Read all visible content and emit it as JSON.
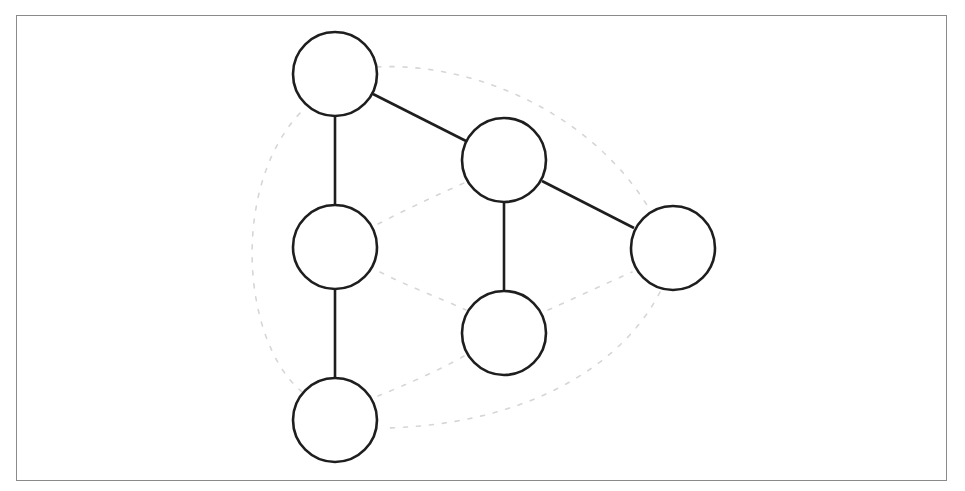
{
  "diagram": {
    "type": "tree-with-traversal-contour",
    "colors": {
      "frame": "#8a8a8a",
      "node_stroke": "#1e1e1e",
      "node_fill": "#ffffff",
      "edge": "#1e1e1e",
      "contour": "#d6d6d6",
      "background": "#ffffff"
    },
    "node_radius": 42,
    "nodes": [
      {
        "id": "root",
        "cx": 335,
        "cy": 74
      },
      {
        "id": "left-child",
        "cx": 335,
        "cy": 247
      },
      {
        "id": "left-grandchild",
        "cx": 335,
        "cy": 420
      },
      {
        "id": "right-child",
        "cx": 504,
        "cy": 160
      },
      {
        "id": "right-child-bottom",
        "cx": 504,
        "cy": 333
      },
      {
        "id": "right-child-right",
        "cx": 673,
        "cy": 248
      }
    ],
    "edges": [
      {
        "from": "root",
        "to": "left-child"
      },
      {
        "from": "left-child",
        "to": "left-grandchild"
      },
      {
        "from": "root",
        "to": "right-child"
      },
      {
        "from": "right-child",
        "to": "right-child-bottom"
      },
      {
        "from": "right-child",
        "to": "right-child-right"
      }
    ],
    "contour_paths": [
      "outer-arc: root -> right-child-right",
      "outer-arc: right-child-right -> left-grandchild",
      "outer-arc: left-grandchild -> root (left side)",
      "inner: left-child -> right-child",
      "inner: left-child -> right-child-bottom",
      "inner: right-child-bottom -> right-child-right",
      "inner: right-child-bottom -> left-grandchild"
    ]
  }
}
